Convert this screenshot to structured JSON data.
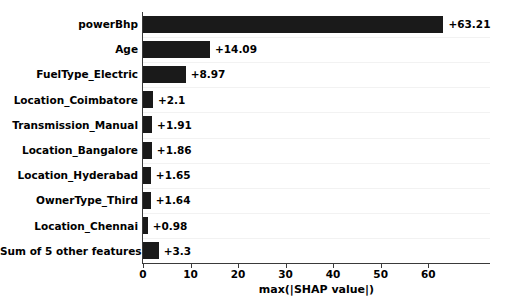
{
  "chart_data": {
    "type": "bar",
    "orientation": "horizontal",
    "title": "",
    "xlabel": "max(|SHAP value|)",
    "ylabel": "",
    "xlim": [
      0,
      73
    ],
    "ylim": [
      0,
      10
    ],
    "grid": true,
    "legend": false,
    "bar_color": "#1a1a1a",
    "categories": [
      "powerBhp",
      "Age",
      "FuelType_Electric",
      "Location_Coimbatore",
      "Transmission_Manual",
      "Location_Bangalore",
      "Location_Hyderabad",
      "OwnerType_Third",
      "Location_Chennai",
      "Sum of 5 other features"
    ],
    "values": [
      63.21,
      14.09,
      8.97,
      2.1,
      1.91,
      1.86,
      1.65,
      1.64,
      0.98,
      3.3
    ],
    "value_labels": [
      "+63.21",
      "+14.09",
      "+8.97",
      "+2.1",
      "+1.91",
      "+1.86",
      "+1.65",
      "+1.64",
      "+0.98",
      "+3.3"
    ],
    "xticks": [
      0,
      10,
      20,
      30,
      40,
      50,
      60
    ],
    "xtick_labels": [
      "0",
      "10",
      "20",
      "30",
      "40",
      "50",
      "60"
    ]
  }
}
